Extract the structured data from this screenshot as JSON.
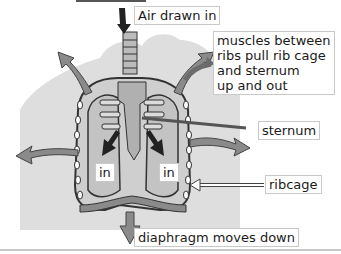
{
  "labels": {
    "air_drawn_in": "Air drawn in",
    "muscles": [
      "muscles between",
      "ribs pull rib cage",
      "and sternum",
      "up and out"
    ],
    "sternum": "sternum",
    "ribcage": "ribcage",
    "in_left": "in",
    "in_right": "in",
    "diaphragm": "diaphragm moves down"
  },
  "colors": {
    "silhouette": "#dcdcdc",
    "lung": "#c8c8c8",
    "arrow": "#8a8a8a",
    "dark_arrow": "#222222",
    "outline": "#333333",
    "label_border": "#c9c9c9"
  }
}
